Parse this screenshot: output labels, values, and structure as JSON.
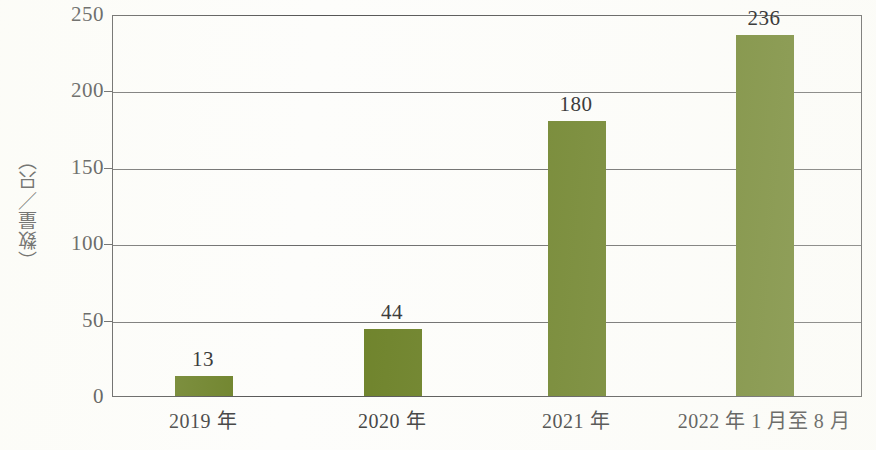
{
  "chart_data": {
    "type": "bar",
    "title": "",
    "subtitle": "",
    "xlabel": "",
    "ylabel": "（数量／只）",
    "categories": [
      "2019 年",
      "2020 年",
      "2021 年",
      "2022 年 1 月至 8 月"
    ],
    "values": [
      13,
      44,
      180,
      236
    ],
    "value_labels": [
      "13",
      "44",
      "180",
      "236"
    ],
    "ylim": [
      0,
      250
    ],
    "ytick_labels": [
      "0",
      "50",
      "100",
      "150",
      "200",
      "250"
    ],
    "ytick_values": [
      0,
      50,
      100,
      150,
      200,
      250
    ],
    "grid": "horizontal",
    "legend": "none",
    "series": [
      {
        "name": "数量",
        "values": [
          13,
          44,
          180,
          236
        ]
      }
    ],
    "colors": {
      "bar": "#6b8026",
      "axis": "#555555",
      "grid": "#6a6a6a",
      "text": "#3a3a3a",
      "background": "#fdfdfb"
    }
  }
}
